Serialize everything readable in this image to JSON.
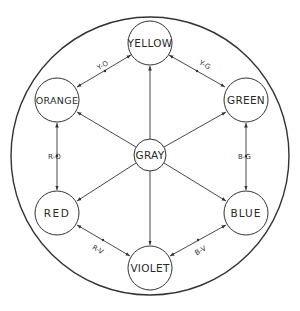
{
  "diagram": {
    "type": "color-relationship-wheel",
    "outer_circle": {
      "cx": 150,
      "cy": 156,
      "r": 139
    },
    "line_color": "#333333",
    "nodes": [
      {
        "id": "yellow",
        "label": "YELLOW",
        "cx": 150,
        "cy": 43,
        "r": 22
      },
      {
        "id": "orange",
        "label": "ORANGE",
        "cx": 57,
        "cy": 100,
        "r": 22
      },
      {
        "id": "green",
        "label": "GREEN",
        "cx": 246,
        "cy": 100,
        "r": 22
      },
      {
        "id": "gray",
        "label": "GRAY",
        "cx": 150,
        "cy": 155,
        "r": 16
      },
      {
        "id": "red",
        "label": "RED",
        "cx": 57,
        "cy": 213,
        "r": 22
      },
      {
        "id": "blue",
        "label": "BLUE",
        "cx": 246,
        "cy": 213,
        "r": 22
      },
      {
        "id": "violet",
        "label": "VIOLET",
        "cx": 150,
        "cy": 268,
        "r": 22
      }
    ],
    "edge_labels": {
      "yo": "Y-O",
      "yg": "Y-G",
      "ro": "R-O",
      "bg": "B-G",
      "rv": "R-V",
      "bv": "B-V"
    },
    "edges": [
      {
        "from": "gray",
        "to": "yellow",
        "type": "single-arrow"
      },
      {
        "from": "gray",
        "to": "orange",
        "type": "single-arrow"
      },
      {
        "from": "gray",
        "to": "green",
        "type": "single-arrow"
      },
      {
        "from": "gray",
        "to": "red",
        "type": "single-arrow"
      },
      {
        "from": "gray",
        "to": "blue",
        "type": "single-arrow"
      },
      {
        "from": "gray",
        "to": "violet",
        "type": "single-arrow"
      },
      {
        "from": "yellow",
        "to": "orange",
        "type": "double-arrow",
        "label": "Y-O"
      },
      {
        "from": "yellow",
        "to": "green",
        "type": "double-arrow",
        "label": "Y-G"
      },
      {
        "from": "orange",
        "to": "red",
        "type": "double-arrow",
        "label": "R-O"
      },
      {
        "from": "green",
        "to": "blue",
        "type": "double-arrow",
        "label": "B-G"
      },
      {
        "from": "red",
        "to": "violet",
        "type": "double-arrow",
        "label": "R-V"
      },
      {
        "from": "blue",
        "to": "violet",
        "type": "double-arrow",
        "label": "B-V"
      }
    ]
  }
}
